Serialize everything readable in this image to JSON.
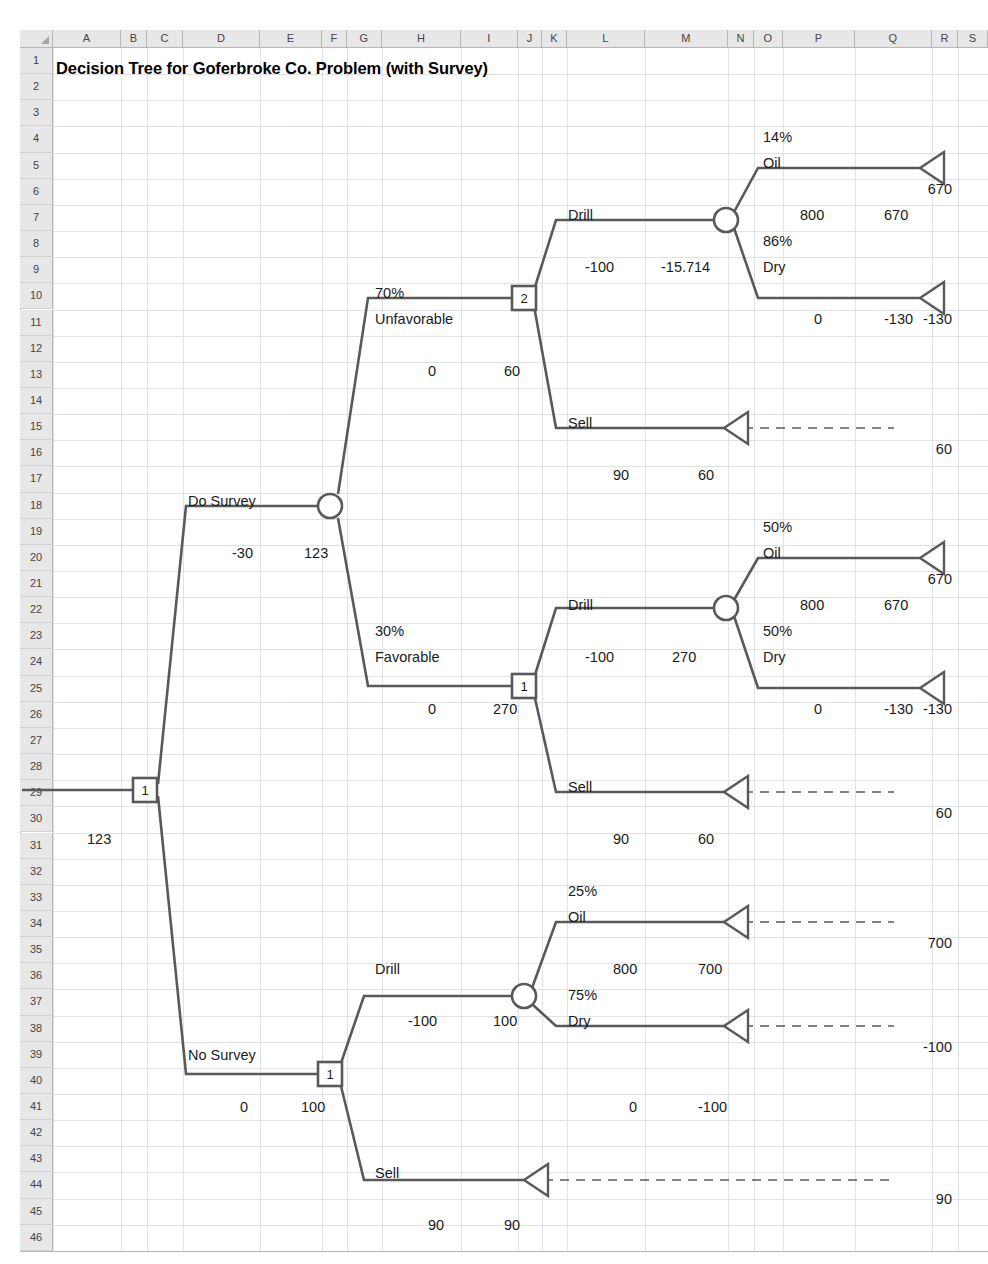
{
  "sheet": {
    "title": "Decision Tree for Goferbroke Co. Problem (with Survey)",
    "columns": [
      {
        "label": "A",
        "x": 53,
        "w": 68
      },
      {
        "label": "B",
        "x": 121,
        "w": 26
      },
      {
        "label": "C",
        "x": 147,
        "w": 36
      },
      {
        "label": "D",
        "x": 183,
        "w": 77
      },
      {
        "label": "E",
        "x": 260,
        "w": 62
      },
      {
        "label": "F",
        "x": 322,
        "w": 25
      },
      {
        "label": "G",
        "x": 347,
        "w": 35
      },
      {
        "label": "H",
        "x": 382,
        "w": 79
      },
      {
        "label": "I",
        "x": 461,
        "w": 57
      },
      {
        "label": "J",
        "x": 518,
        "w": 24
      },
      {
        "label": "K",
        "x": 542,
        "w": 25
      },
      {
        "label": "L",
        "x": 567,
        "w": 78
      },
      {
        "label": "M",
        "x": 645,
        "w": 83
      },
      {
        "label": "N",
        "x": 728,
        "w": 26
      },
      {
        "label": "O",
        "x": 754,
        "w": 29
      },
      {
        "label": "P",
        "x": 783,
        "w": 72
      },
      {
        "label": "Q",
        "x": 855,
        "w": 77
      },
      {
        "label": "R",
        "x": 932,
        "w": 26
      },
      {
        "label": "S",
        "x": 958,
        "w": 30
      }
    ],
    "rows": [
      "1",
      "2",
      "3",
      "4",
      "5",
      "6",
      "7",
      "8",
      "9",
      "10",
      "11",
      "12",
      "13",
      "14",
      "15",
      "16",
      "17",
      "18",
      "19",
      "20",
      "21",
      "22",
      "23",
      "24",
      "25",
      "26",
      "27",
      "28",
      "29",
      "30",
      "31",
      "32",
      "33",
      "34",
      "35",
      "36",
      "37",
      "38",
      "39",
      "40",
      "41",
      "42",
      "43",
      "44",
      "45",
      "46"
    ],
    "grid_color": "#dfe3e8",
    "header_fill": "#e7e7e7",
    "line_color": "#595959"
  },
  "chart_data": {
    "type": "diagram",
    "title": "Decision Tree for Goferbroke Co. Problem (with Survey)",
    "nodes": [
      {
        "id": "root",
        "type": "decision",
        "label": "1",
        "x": 145,
        "y": 790
      },
      {
        "id": "survey-event",
        "type": "event",
        "label": "",
        "x": 330,
        "y": 506
      },
      {
        "id": "unfav-decision",
        "type": "decision",
        "label": "2",
        "x": 524,
        "y": 298
      },
      {
        "id": "unfav-drill-event",
        "type": "event",
        "label": "",
        "x": 726,
        "y": 220
      },
      {
        "id": "fav-decision",
        "type": "decision",
        "label": "1",
        "x": 524,
        "y": 686
      },
      {
        "id": "fav-drill-event",
        "type": "event",
        "label": "",
        "x": 726,
        "y": 608
      },
      {
        "id": "nosurvey-decision",
        "type": "decision",
        "label": "1",
        "x": 330,
        "y": 1074
      },
      {
        "id": "nosurvey-drill-event",
        "type": "event",
        "label": "",
        "x": 524,
        "y": 996
      }
    ],
    "branches": [
      {
        "name": "Do Survey",
        "cost": "-30",
        "value": "123"
      },
      {
        "name": "No Survey",
        "cost": "0",
        "value": "100"
      },
      {
        "name": "Unfavorable",
        "prob": "70%",
        "cost": "0",
        "value": "60"
      },
      {
        "name": "Favorable",
        "prob": "30%",
        "cost": "0",
        "value": "270"
      },
      {
        "name": "Drill (unfavorable)",
        "cost": "-100",
        "value": "-15.714"
      },
      {
        "name": "Sell (unfavorable)",
        "cost": "90",
        "value": "60"
      },
      {
        "name": "Drill (favorable)",
        "cost": "-100",
        "value": "270"
      },
      {
        "name": "Sell (favorable)",
        "cost": "90",
        "value": "60"
      },
      {
        "name": "Drill (no survey)",
        "cost": "-100",
        "value": "100"
      },
      {
        "name": "Sell (no survey)",
        "cost": "90",
        "value": "90"
      },
      {
        "name": "Oil (unfavorable)",
        "prob": "14%",
        "cost": "800",
        "value": "670"
      },
      {
        "name": "Dry (unfavorable)",
        "prob": "86%",
        "cost": "0",
        "value": "-130"
      },
      {
        "name": "Oil (favorable)",
        "prob": "50%",
        "cost": "800",
        "value": "670"
      },
      {
        "name": "Dry (favorable)",
        "prob": "50%",
        "cost": "0",
        "value": "-130"
      },
      {
        "name": "Oil (no survey)",
        "prob": "25%",
        "cost": "800",
        "value": "700"
      },
      {
        "name": "Dry (no survey)",
        "prob": "75%",
        "cost": "0",
        "value": "-100"
      }
    ],
    "payoffs": [
      "670",
      "-130",
      "60",
      "670",
      "-130",
      "60",
      "700",
      "-100",
      "90"
    ],
    "root_value": "123"
  },
  "labels": [
    {
      "key": "t1",
      "text": "14%",
      "x": 763,
      "y": 130
    },
    {
      "key": "t2",
      "text": "Oil",
      "x": 763,
      "y": 156
    },
    {
      "key": "t3",
      "text": "670",
      "x": 952,
      "y": 182,
      "align": "right"
    },
    {
      "key": "t4",
      "text": "Drill",
      "x": 568,
      "y": 208
    },
    {
      "key": "t5",
      "text": "800",
      "x": 800,
      "y": 208
    },
    {
      "key": "t6",
      "text": "670",
      "x": 884,
      "y": 208
    },
    {
      "key": "t7",
      "text": "-100",
      "x": 585,
      "y": 260
    },
    {
      "key": "t8",
      "text": "-15.714",
      "x": 661,
      "y": 260
    },
    {
      "key": "t9",
      "text": "86%",
      "x": 763,
      "y": 234
    },
    {
      "key": "t10",
      "text": "Dry",
      "x": 763,
      "y": 260
    },
    {
      "key": "t11",
      "text": "-130",
      "x": 952,
      "y": 312,
      "align": "right"
    },
    {
      "key": "t12",
      "text": "70%",
      "x": 375,
      "y": 286
    },
    {
      "key": "t13",
      "text": "Unfavorable",
      "x": 375,
      "y": 312
    },
    {
      "key": "t14",
      "text": "0",
      "x": 428,
      "y": 364
    },
    {
      "key": "t15",
      "text": "60",
      "x": 504,
      "y": 364
    },
    {
      "key": "t16",
      "text": "0",
      "x": 814,
      "y": 312
    },
    {
      "key": "t17",
      "text": "-130",
      "x": 884,
      "y": 312
    },
    {
      "key": "t18",
      "text": "Sell",
      "x": 568,
      "y": 416
    },
    {
      "key": "t19",
      "text": "60",
      "x": 952,
      "y": 442,
      "align": "right"
    },
    {
      "key": "t20",
      "text": "90",
      "x": 613,
      "y": 468
    },
    {
      "key": "t21",
      "text": "60",
      "x": 698,
      "y": 468
    },
    {
      "key": "t22",
      "text": "Do Survey",
      "x": 188,
      "y": 494
    },
    {
      "key": "t23",
      "text": "-30",
      "x": 232,
      "y": 546
    },
    {
      "key": "t24",
      "text": "123",
      "x": 304,
      "y": 546
    },
    {
      "key": "t25",
      "text": "50%",
      "x": 763,
      "y": 520
    },
    {
      "key": "t26",
      "text": "Oil",
      "x": 763,
      "y": 546
    },
    {
      "key": "t27",
      "text": "670",
      "x": 952,
      "y": 572,
      "align": "right"
    },
    {
      "key": "t28",
      "text": "Drill",
      "x": 568,
      "y": 598
    },
    {
      "key": "t29",
      "text": "800",
      "x": 800,
      "y": 598
    },
    {
      "key": "t30",
      "text": "670",
      "x": 884,
      "y": 598
    },
    {
      "key": "t31",
      "text": "-100",
      "x": 585,
      "y": 650
    },
    {
      "key": "t32",
      "text": "270",
      "x": 672,
      "y": 650
    },
    {
      "key": "t33",
      "text": "50%",
      "x": 763,
      "y": 624
    },
    {
      "key": "t34",
      "text": "Dry",
      "x": 763,
      "y": 650
    },
    {
      "key": "t35",
      "text": "-130",
      "x": 952,
      "y": 702,
      "align": "right"
    },
    {
      "key": "t36",
      "text": "30%",
      "x": 375,
      "y": 624
    },
    {
      "key": "t37",
      "text": "Favorable",
      "x": 375,
      "y": 650
    },
    {
      "key": "t38",
      "text": "0",
      "x": 428,
      "y": 702
    },
    {
      "key": "t39",
      "text": "270",
      "x": 493,
      "y": 702
    },
    {
      "key": "t40",
      "text": "0",
      "x": 814,
      "y": 702
    },
    {
      "key": "t41",
      "text": "-130",
      "x": 884,
      "y": 702
    },
    {
      "key": "t42",
      "text": "Sell",
      "x": 568,
      "y": 780
    },
    {
      "key": "t43",
      "text": "60",
      "x": 952,
      "y": 806,
      "align": "right"
    },
    {
      "key": "t44",
      "text": "90",
      "x": 613,
      "y": 832
    },
    {
      "key": "t45",
      "text": "60",
      "x": 698,
      "y": 832
    },
    {
      "key": "t46",
      "text": "123",
      "x": 87,
      "y": 832
    },
    {
      "key": "t47",
      "text": "25%",
      "x": 568,
      "y": 884
    },
    {
      "key": "t48",
      "text": "Oil",
      "x": 568,
      "y": 910
    },
    {
      "key": "t49",
      "text": "700",
      "x": 952,
      "y": 936,
      "align": "right"
    },
    {
      "key": "t50",
      "text": "Drill",
      "x": 375,
      "y": 962
    },
    {
      "key": "t51",
      "text": "800",
      "x": 613,
      "y": 962
    },
    {
      "key": "t52",
      "text": "700",
      "x": 698,
      "y": 962
    },
    {
      "key": "t53",
      "text": "-100",
      "x": 408,
      "y": 1014
    },
    {
      "key": "t54",
      "text": "100",
      "x": 493,
      "y": 1014
    },
    {
      "key": "t55",
      "text": "75%",
      "x": 568,
      "y": 988
    },
    {
      "key": "t56",
      "text": "Dry",
      "x": 568,
      "y": 1014
    },
    {
      "key": "t57",
      "text": "-100",
      "x": 952,
      "y": 1040,
      "align": "right"
    },
    {
      "key": "t58",
      "text": "No Survey",
      "x": 188,
      "y": 1048
    },
    {
      "key": "t59",
      "text": "0",
      "x": 240,
      "y": 1100
    },
    {
      "key": "t60",
      "text": "100",
      "x": 301,
      "y": 1100
    },
    {
      "key": "t61",
      "text": "0",
      "x": 629,
      "y": 1100
    },
    {
      "key": "t62",
      "text": "-100",
      "x": 698,
      "y": 1100
    },
    {
      "key": "t63",
      "text": "Sell",
      "x": 375,
      "y": 1166
    },
    {
      "key": "t64",
      "text": "90",
      "x": 952,
      "y": 1192,
      "align": "right"
    },
    {
      "key": "t65",
      "text": "90",
      "x": 428,
      "y": 1218
    },
    {
      "key": "t66",
      "text": "90",
      "x": 504,
      "y": 1218
    }
  ]
}
